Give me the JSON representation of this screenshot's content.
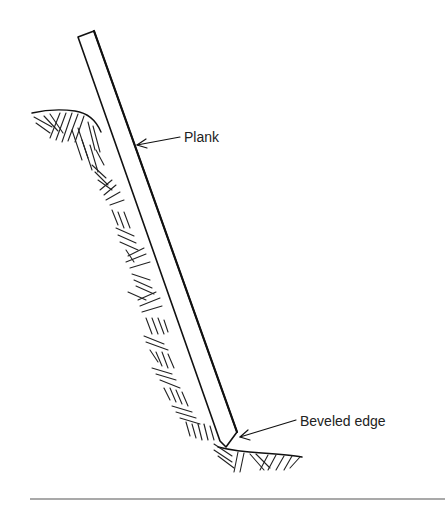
{
  "figure": {
    "labels": {
      "plank": "Plank",
      "beveled_edge": "Beveled edge"
    },
    "colors": {
      "ink": "#111111",
      "background": "#ffffff"
    }
  }
}
